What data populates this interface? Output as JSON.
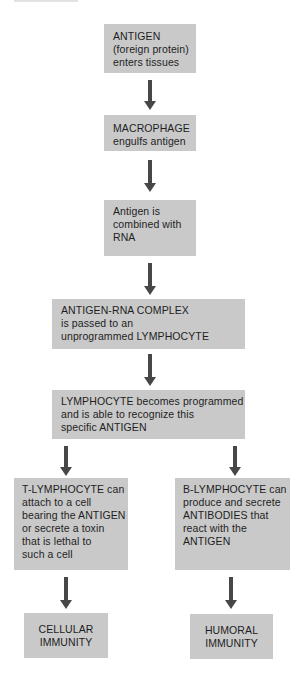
{
  "diagram": {
    "type": "flowchart",
    "colors": {
      "box_fill": "#c9c9c9",
      "arrow": "#474747",
      "text": "#1e1e1e",
      "background": "#ffffff"
    },
    "nodes": [
      {
        "id": "antigen",
        "lines": [
          "ANTIGEN",
          "(foreign protein)",
          "enters tissues"
        ]
      },
      {
        "id": "macrophage",
        "lines": [
          "MACROPHAGE",
          "engulfs antigen"
        ]
      },
      {
        "id": "antigen-rna",
        "lines": [
          "Antigen is",
          "combined with",
          "RNA"
        ]
      },
      {
        "id": "complex",
        "lines": [
          "ANTIGEN-RNA COMPLEX",
          "is passed to an",
          "unprogrammed LYMPHOCYTE"
        ]
      },
      {
        "id": "programmed",
        "lines": [
          "LYMPHOCYTE becomes programmed",
          "and is able to recognize this",
          "specific ANTIGEN"
        ]
      },
      {
        "id": "t-lymphocyte",
        "lines": [
          "T-LYMPHOCYTE can",
          "attach to a cell",
          "bearing the ANTIGEN",
          "or secrete a toxin",
          "that is lethal to",
          "such a cell"
        ]
      },
      {
        "id": "b-lymphocyte",
        "lines": [
          "B-LYMPHOCYTE can",
          "produce and secrete",
          "ANTIBODIES that",
          "react with the",
          "ANTIGEN"
        ]
      },
      {
        "id": "cellular",
        "lines": [
          "CELLULAR",
          "IMMUNITY"
        ]
      },
      {
        "id": "humoral",
        "lines": [
          "HUMORAL",
          "IMMUNITY"
        ]
      }
    ],
    "edges": [
      {
        "from": "antigen",
        "to": "macrophage"
      },
      {
        "from": "macrophage",
        "to": "antigen-rna"
      },
      {
        "from": "antigen-rna",
        "to": "complex"
      },
      {
        "from": "complex",
        "to": "programmed"
      },
      {
        "from": "programmed",
        "to": "t-lymphocyte"
      },
      {
        "from": "programmed",
        "to": "b-lymphocyte"
      },
      {
        "from": "t-lymphocyte",
        "to": "cellular"
      },
      {
        "from": "b-lymphocyte",
        "to": "humoral"
      }
    ]
  }
}
